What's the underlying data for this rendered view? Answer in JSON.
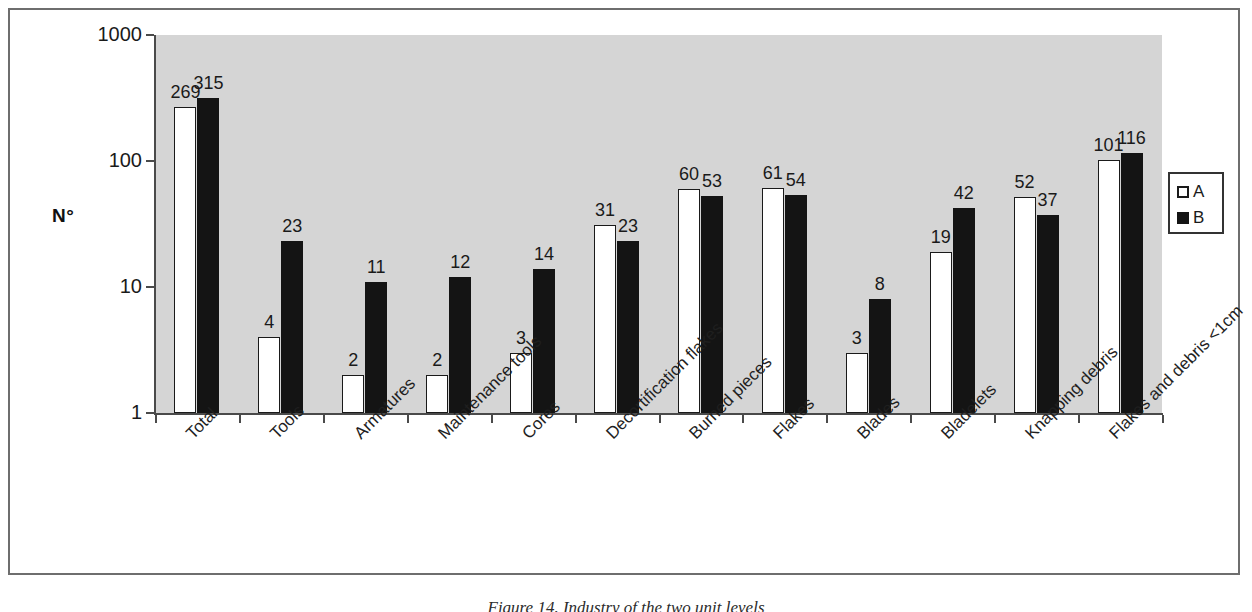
{
  "chart_data": {
    "type": "bar",
    "title": "",
    "subtitle": "",
    "xlabel": "",
    "ylabel": "N°",
    "yscale": "log",
    "ylim": [
      1,
      1000
    ],
    "ytick_labels": [
      "1000",
      "100",
      "10",
      "1"
    ],
    "ytick_values": [
      1000,
      100,
      10,
      1
    ],
    "grid": false,
    "legend_position": "right",
    "categories": [
      "Total",
      "Tools",
      "Armatures",
      "Maintenance tools",
      "Cores",
      "Decortification flakes",
      "Burned pieces",
      "Flakes",
      "Blades",
      "Bladelets",
      "Knapping debris",
      "Flakes and debris <1cm"
    ],
    "series": [
      {
        "name": "A",
        "color": "#ffffff",
        "edge_color": "#1a1a1a",
        "values": [
          269,
          4,
          2,
          2,
          3,
          31,
          60,
          61,
          3,
          19,
          52,
          101
        ]
      },
      {
        "name": "B",
        "color": "#141414",
        "edge_color": "#141414",
        "values": [
          315,
          23,
          11,
          12,
          14,
          23,
          53,
          54,
          8,
          42,
          37,
          116
        ]
      }
    ]
  },
  "legend": {
    "entries": [
      {
        "label": "A",
        "swatch": "hollow-square"
      },
      {
        "label": "B",
        "swatch": "filled-square"
      }
    ]
  },
  "colors": {
    "plot_background": "#d5d5d5",
    "figure_background": "#ffffff",
    "axis": "#4a4a4a",
    "text": "#1a1a1a",
    "frame": "#6e6e6e"
  },
  "caption": {
    "text": "Figure 14. Industry of the two unit levels"
  }
}
